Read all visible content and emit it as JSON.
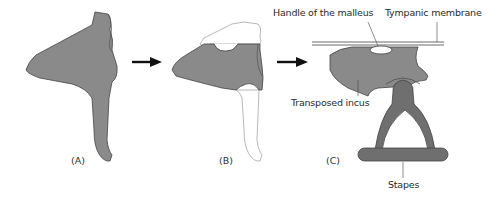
{
  "panels": [
    {
      "id": "A",
      "label": "(A)"
    },
    {
      "id": "B",
      "label": "(B)"
    },
    {
      "id": "C",
      "label": "(C)"
    }
  ],
  "labels": {
    "handle_of_malleus": "Handle of the malleus",
    "tympanic_membrane": "Tympanic membrane",
    "transposed_incus": "Transposed incus",
    "stapes": "Stapes"
  },
  "colors": {
    "bone_fill": "#8a8a8a",
    "bone_dark": "#6f6f6f",
    "outline": "#444444",
    "removed_fill": "#ffffff",
    "arrow": "#111111"
  },
  "arrows": [
    {
      "from": "A",
      "to": "B"
    },
    {
      "from": "B",
      "to": "C"
    }
  ]
}
